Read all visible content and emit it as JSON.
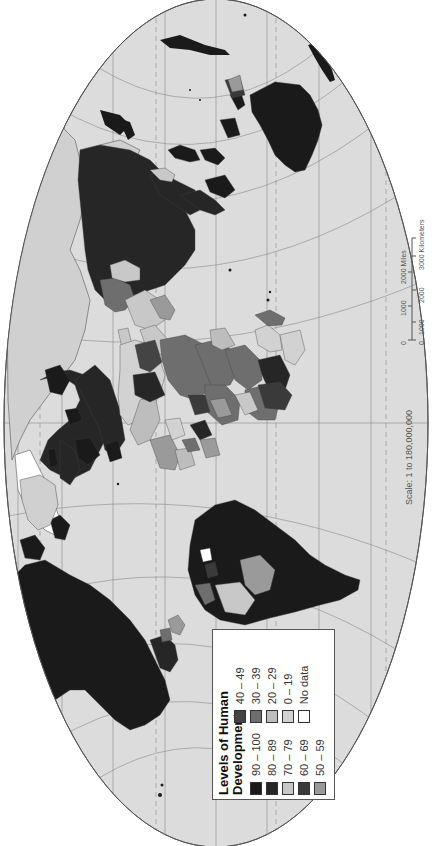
{
  "map": {
    "title": "Levels of Human Development",
    "orientation": "rotated 90 degrees clockwise (north to the right)",
    "colors": {
      "ocean": "#dcdcdc",
      "frame": "#555555",
      "graticule": "#8a8a8a",
      "coastline": "#555555"
    }
  },
  "legend": {
    "title_line1": "Levels of Human",
    "title_line2": "Development",
    "items": [
      {
        "label": "90 – 100",
        "color": "#1a1a1a"
      },
      {
        "label": "80 – 89",
        "color": "#262626"
      },
      {
        "label": "70 – 79",
        "color": "#c8c8c8"
      },
      {
        "label": "60 – 69",
        "color": "#3a3a3a"
      },
      {
        "label": "50 – 59",
        "color": "#9a9a9a"
      },
      {
        "label": "40 – 49",
        "color": "#444444"
      },
      {
        "label": "30 – 39",
        "color": "#6e6e6e"
      },
      {
        "label": "20 – 29",
        "color": "#bdbdbd"
      },
      {
        "label": "0 – 19",
        "color": "#d2d2d2"
      },
      {
        "label": "No data",
        "color": "#ffffff"
      }
    ]
  },
  "scale": {
    "text": "Scale: 1 to 180,000,000",
    "miles_labels": [
      "0",
      "1000",
      "2000 Miles"
    ],
    "km_labels": [
      "0",
      "1000",
      "2000",
      "3000 Kilometers"
    ]
  }
}
